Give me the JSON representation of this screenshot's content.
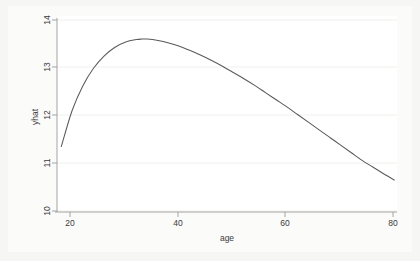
{
  "chart_data": {
    "type": "line",
    "title": "",
    "subtitle": "",
    "xlabel": "age",
    "ylabel": "yhat",
    "xlim": [
      17.2,
      80.5
    ],
    "ylim": [
      10,
      14.1
    ],
    "xticks": [
      20,
      40,
      60,
      80
    ],
    "xtick_labels": [
      "20",
      "40",
      "60",
      "80"
    ],
    "yticks": [
      10,
      11,
      12,
      13,
      14
    ],
    "ytick_labels": [
      "10",
      "11",
      "12",
      "13",
      "14"
    ],
    "grid": "horizontal-faint",
    "legend": "none",
    "legend_position": "none",
    "series": [
      {
        "name": "yhat",
        "color": "#5a5a5a",
        "x": [
          18,
          20,
          22,
          24,
          26,
          28,
          30,
          32,
          33,
          34,
          36,
          38,
          40,
          42,
          44,
          46,
          48,
          50,
          52,
          54,
          56,
          58,
          60,
          62,
          64,
          66,
          68,
          70,
          72,
          74,
          76,
          78,
          80
        ],
        "y": [
          11.35,
          12.1,
          12.62,
          12.99,
          13.25,
          13.43,
          13.54,
          13.59,
          13.6,
          13.6,
          13.57,
          13.52,
          13.45,
          13.36,
          13.26,
          13.15,
          13.03,
          12.9,
          12.77,
          12.63,
          12.48,
          12.33,
          12.18,
          12.02,
          11.86,
          11.7,
          11.54,
          11.38,
          11.22,
          11.06,
          10.92,
          10.78,
          10.65
        ]
      }
    ],
    "annotations": []
  },
  "axes": {
    "x_axis_title": "age",
    "y_axis_title": "yhat",
    "x_tick_labels": [
      "20",
      "40",
      "60",
      "80"
    ],
    "y_tick_labels": [
      "10",
      "11",
      "12",
      "13",
      "14"
    ]
  },
  "colors": {
    "curve": "#5a5a5a",
    "axis": "#9a9a9a",
    "grid": "#f0f0ee",
    "plot_background": "#ffffff",
    "figure_background": "#f6f6f4",
    "text": "#3a3a3a"
  }
}
